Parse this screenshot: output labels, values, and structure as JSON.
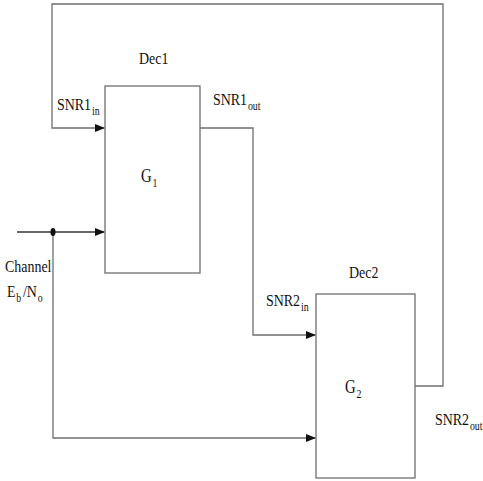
{
  "diagram": {
    "type": "block-diagram",
    "colors": {
      "line": "#6e6e6e",
      "arrow": "#111111",
      "text": "#111111",
      "background": "#ffffff"
    },
    "blocks": [
      {
        "id": "dec1",
        "title": "Dec1",
        "function_base": "G",
        "function_sub": "1"
      },
      {
        "id": "dec2",
        "title": "Dec2",
        "function_base": "G",
        "function_sub": "2"
      }
    ],
    "signals": {
      "snr1_in": {
        "base": "SNR1",
        "sub": "in"
      },
      "snr1_out": {
        "base": "SNR1",
        "sub": "out"
      },
      "snr2_in": {
        "base": "SNR2",
        "sub": "in"
      },
      "snr2_out": {
        "base": "SNR2",
        "sub": "out"
      },
      "channel": {
        "line1": "Channel",
        "eb": "E",
        "eb_sub": "b",
        "slash": "/N",
        "no_sub": "o"
      }
    },
    "edges": [
      {
        "from": "dec2",
        "to": "dec1",
        "label": "SNR2_out -> SNR1_in (feedback)"
      },
      {
        "from": "dec1",
        "to": "dec2",
        "label": "SNR1_out -> SNR2_in"
      },
      {
        "from": "channel",
        "to": "dec1",
        "label": "Eb/No"
      },
      {
        "from": "channel",
        "to": "dec2",
        "label": "Eb/No"
      }
    ]
  }
}
